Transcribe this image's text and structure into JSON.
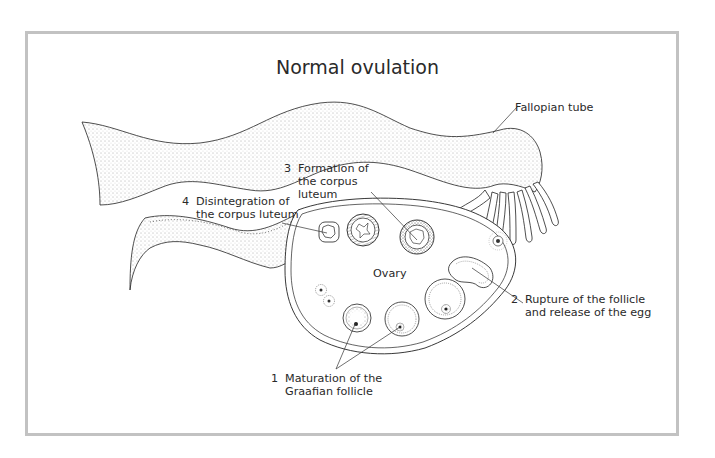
{
  "diagram": {
    "title": "Normal ovulation",
    "frame_border_color": "#c2c2c2",
    "labels": {
      "fallopian_tube": "Fallopian tube",
      "ovary": "Ovary",
      "step1": {
        "number": "1",
        "line1": "Maturation of the",
        "line2": "Graafian follicle"
      },
      "step2": {
        "number": "2",
        "line1": "Rupture of the follicle",
        "line2": "and release of the egg"
      },
      "step3": {
        "number": "3",
        "line1": "Formation of",
        "line2": "the corpus",
        "line3": "luteum"
      },
      "step4": {
        "number": "4",
        "line1": "Disintegration of",
        "line2": "the corpus luteum"
      }
    }
  }
}
